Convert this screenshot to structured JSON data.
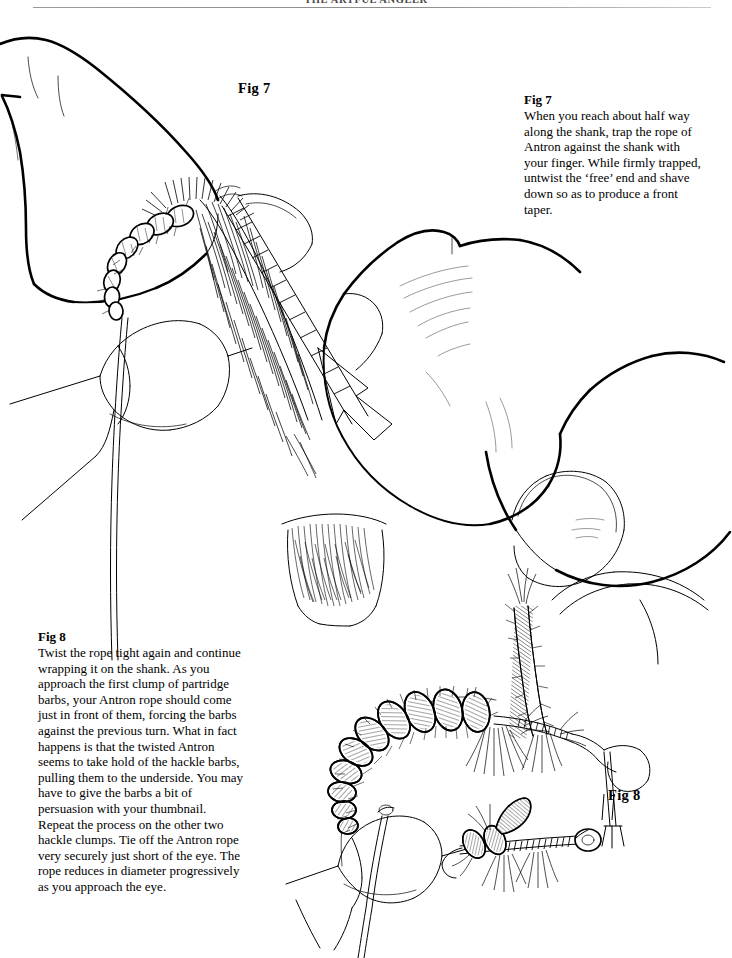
{
  "page": {
    "width": 732,
    "height": 958,
    "background_color": "#ffffff",
    "ink_color": "#000000"
  },
  "header": {
    "running_title": "THE ARTFUL ANGLER",
    "rule_color": "#8c8c8c"
  },
  "figures": [
    {
      "id": "fig7",
      "tag": "Fig 7",
      "caption_label": "Fig 7",
      "caption_body": "When you reach about half way along the shank, trap the rope of Antron against the shank with your finger. While firmly trapped, untwist the ‘free’ end and shave down so as to produce a front taper."
    },
    {
      "id": "fig8",
      "tag": "Fig 8",
      "caption_label": "Fig 8",
      "caption_body": "Twist the rope tight again and continue wrapping it on the shank. As you approach the first clump of partridge barbs, your Antron rope should come just in front of them, forcing the barbs against the previous turn. What in fact happens is that the twisted Antron seems to take hold of the hackle barbs, pulling them to the underside. You may have to give the barbs a bit of persuasion with your thumbnail. Repeat the process on the other two hackle clumps. Tie off the Antron rope very securely just short of the eye. The rope reduces in diameter progressively as you approach the eye."
    }
  ],
  "illustrations": {
    "upper": {
      "name": "fig7-illustration",
      "description": "Line drawing of two hands holding a fly-tying vise; fingers trap a twisted Antron rope against the hook shank of a partly dressed fly."
    },
    "lower": {
      "name": "fig8-illustration",
      "description": "Line drawing of a hand with thumbnail pressing hackle barbs, a large segmented Antron-bodied fly on a hook in a vise, and a smaller completed fly shown in profile."
    }
  }
}
